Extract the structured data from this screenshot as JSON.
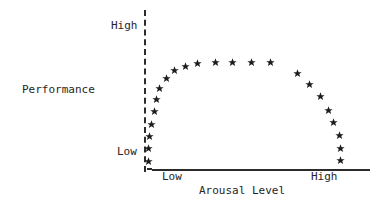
{
  "figure": {
    "width": 387,
    "height": 206,
    "background_color": "#ffffff",
    "ink_color": "#262626"
  },
  "labels": {
    "y_axis_title": "Performance",
    "y_tick_top": "High",
    "y_tick_bottom": "Low",
    "x_tick_left": "Low",
    "x_tick_right": "High",
    "x_axis_title": "Arousal Level"
  },
  "marker": {
    "name": "star-marker",
    "glyph": "★",
    "color": "#1c1c1c",
    "size_px": 5
  },
  "axes": {
    "y_axis_style": "dashed",
    "x_axis_style": "solid",
    "y_axis_color": "#2b2b2b",
    "x_axis_color": "#2b2b2b"
  },
  "chart_data": {
    "type": "scatter",
    "title": "",
    "subtitle": "",
    "xlabel": "Arousal Level",
    "ylabel": "Performance",
    "xlim": [
      0,
      100
    ],
    "ylim": [
      0,
      100
    ],
    "xtick_labels": [
      "Low",
      "High"
    ],
    "xtick_values": [
      8,
      76
    ],
    "ytick_labels": [
      "Low",
      "High"
    ],
    "ytick_values": [
      8,
      96
    ],
    "grid": false,
    "legend": null,
    "annotations": [],
    "series": [
      {
        "name": "Performance vs Arousal",
        "marker": "star",
        "points": [
          {
            "x": 2,
            "y": 5
          },
          {
            "x": 2,
            "y": 13
          },
          {
            "x": 2,
            "y": 21
          },
          {
            "x": 3,
            "y": 30
          },
          {
            "x": 5,
            "y": 39
          },
          {
            "x": 8,
            "y": 47
          },
          {
            "x": 12,
            "y": 55
          },
          {
            "x": 17,
            "y": 62
          },
          {
            "x": 23,
            "y": 69
          },
          {
            "x": 30,
            "y": 75
          },
          {
            "x": 38,
            "y": 79
          },
          {
            "x": 46,
            "y": 79
          },
          {
            "x": 54,
            "y": 79
          },
          {
            "x": 63,
            "y": 79
          },
          {
            "x": 70,
            "y": 72
          },
          {
            "x": 76,
            "y": 65
          },
          {
            "x": 81,
            "y": 57
          },
          {
            "x": 85,
            "y": 48
          },
          {
            "x": 88,
            "y": 40
          },
          {
            "x": 91,
            "y": 31
          },
          {
            "x": 91,
            "y": 22
          },
          {
            "x": 91,
            "y": 13
          }
        ]
      }
    ]
  },
  "pixel_points": [
    {
      "x": 148,
      "y": 161
    },
    {
      "x": 148,
      "y": 148
    },
    {
      "x": 149,
      "y": 136
    },
    {
      "x": 151,
      "y": 124
    },
    {
      "x": 154,
      "y": 111
    },
    {
      "x": 156,
      "y": 99
    },
    {
      "x": 159,
      "y": 88
    },
    {
      "x": 166,
      "y": 78
    },
    {
      "x": 174,
      "y": 70
    },
    {
      "x": 185,
      "y": 66
    },
    {
      "x": 197,
      "y": 63
    },
    {
      "x": 215,
      "y": 62
    },
    {
      "x": 232,
      "y": 62
    },
    {
      "x": 251,
      "y": 62
    },
    {
      "x": 270,
      "y": 62
    },
    {
      "x": 297,
      "y": 73
    },
    {
      "x": 309,
      "y": 84
    },
    {
      "x": 320,
      "y": 96
    },
    {
      "x": 328,
      "y": 110
    },
    {
      "x": 333,
      "y": 122
    },
    {
      "x": 339,
      "y": 135
    },
    {
      "x": 340,
      "y": 148
    },
    {
      "x": 340,
      "y": 160
    }
  ]
}
